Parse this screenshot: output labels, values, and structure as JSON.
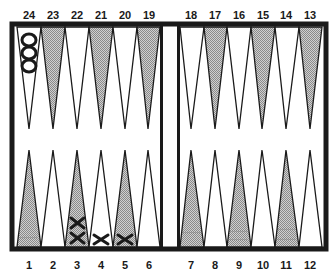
{
  "board": {
    "type": "backgammon",
    "colors": {
      "border": "#1a1a1a",
      "shaded_point": "#b8b8b8",
      "light_point": "#ffffff",
      "checker_o": "#1a1a1a",
      "checker_x": "#1a1a1a"
    },
    "top_labels": [
      "24",
      "23",
      "22",
      "21",
      "20",
      "19",
      "18",
      "17",
      "16",
      "15",
      "14",
      "13"
    ],
    "bottom_labels": [
      "1",
      "2",
      "3",
      "4",
      "5",
      "6",
      "7",
      "8",
      "9",
      "10",
      "11",
      "12"
    ],
    "top_points_shaded": [
      false,
      true,
      false,
      true,
      false,
      true,
      false,
      true,
      false,
      true,
      false,
      true
    ],
    "bottom_points_shaded": [
      true,
      false,
      true,
      false,
      true,
      false,
      true,
      false,
      true,
      false,
      true,
      false
    ],
    "checkers": [
      {
        "point": 24,
        "player": "O",
        "count": 3
      },
      {
        "point": 3,
        "player": "X",
        "count": 2
      },
      {
        "point": 4,
        "player": "X",
        "count": 1
      },
      {
        "point": 5,
        "player": "X",
        "count": 1
      }
    ]
  }
}
